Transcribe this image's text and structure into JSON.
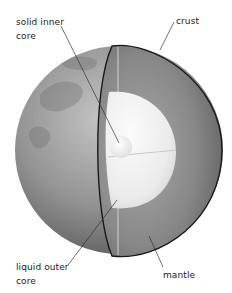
{
  "diagram": {
    "type": "cutaway",
    "colors": {
      "background": "#ffffff",
      "globe_dark": "#5a5a5a",
      "globe_mid": "#8e8e8e",
      "globe_light": "#bdbdbd",
      "mantle_dark": "#6a6a6a",
      "mantle_light": "#9a9a9a",
      "outer_core": "#eeeeee",
      "inner_core": "#f8f8f8",
      "crust_line": "#1a1a1a",
      "leader_line": "#333333",
      "text": "#222222"
    },
    "labels": {
      "inner_core": {
        "line1": "solid inner",
        "line2": "core"
      },
      "crust": {
        "line1": "crust"
      },
      "outer_core": {
        "line1": "liquid outer",
        "line2": "core"
      },
      "mantle": {
        "line1": "mantle"
      }
    }
  }
}
